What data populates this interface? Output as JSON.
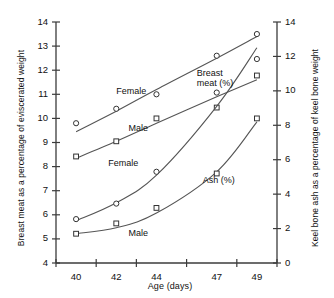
{
  "chart_data": {
    "type": "scatter",
    "title": "",
    "xlabel": "Age (days)",
    "ylabel": "Breast meat as a percentage of eviscerated weight",
    "ylabel_right": "Keel bone ash as a percentage of keel bone weight",
    "x_tick_labels": [
      "40",
      "42",
      "44",
      "47",
      "49"
    ],
    "x_values": [
      40,
      42,
      44,
      47,
      49
    ],
    "xlim": [
      39,
      50
    ],
    "ylim": [
      4,
      14
    ],
    "ylim_right": [
      0,
      14
    ],
    "y_tick_labels": [
      "4",
      "5",
      "6",
      "7",
      "8",
      "9",
      "10",
      "11",
      "12",
      "13",
      "14"
    ],
    "y_tick_values": [
      4,
      5,
      6,
      7,
      8,
      9,
      10,
      11,
      12,
      13,
      14
    ],
    "y_right_tick_labels": [
      "0",
      "2",
      "4",
      "6",
      "8",
      "10",
      "12",
      "14"
    ],
    "y_right_tick_values": [
      0,
      2,
      4,
      6,
      8,
      10,
      12,
      14
    ],
    "grid": false,
    "legend": "inline-annotations",
    "annotations": [
      {
        "text": "Breast\nmeat (%)",
        "line1": "Breast",
        "line2": "meat (%)",
        "x": 47.0,
        "y": 11.85
      },
      {
        "text": "Ash (%)",
        "line1": "Ash (%)",
        "line2": "",
        "x": 47.3,
        "y": 7.4
      },
      {
        "text": "Female",
        "line1": "Female",
        "line2": "",
        "x": 43.0,
        "y": 11.1
      },
      {
        "text": "Male",
        "line1": "Male",
        "line2": "",
        "x": 43.6,
        "y": 9.55
      },
      {
        "text": "Female",
        "line1": "Female",
        "line2": "",
        "x": 42.6,
        "y": 8.1
      },
      {
        "text": "Male",
        "line1": "Male",
        "line2": "",
        "x": 43.6,
        "y": 5.2
      }
    ],
    "series": [
      {
        "name": "Breast meat (%) - Female",
        "axis": "left",
        "marker": "circle",
        "points": [
          {
            "x": 40,
            "y": 9.8
          },
          {
            "x": 42,
            "y": 10.4
          },
          {
            "x": 44,
            "y": 11.0
          },
          {
            "x": 47,
            "y": 12.6
          },
          {
            "x": 49,
            "y": 13.5
          }
        ],
        "fit": [
          {
            "x": 40.0,
            "y": 9.45
          },
          {
            "x": 42.0,
            "y": 10.3
          },
          {
            "x": 44.0,
            "y": 11.2
          },
          {
            "x": 47.0,
            "y": 12.5
          },
          {
            "x": 49.0,
            "y": 13.4
          }
        ]
      },
      {
        "name": "Breast meat (%) - Male",
        "axis": "left",
        "marker": "square",
        "points": [
          {
            "x": 40,
            "y": 8.42
          },
          {
            "x": 42,
            "y": 9.05
          },
          {
            "x": 44,
            "y": 10.0
          },
          {
            "x": 47,
            "y": 10.45
          },
          {
            "x": 49,
            "y": 11.78
          }
        ],
        "fit": [
          {
            "x": 40.0,
            "y": 8.35
          },
          {
            "x": 42.0,
            "y": 9.05
          },
          {
            "x": 44.0,
            "y": 9.8
          },
          {
            "x": 47.0,
            "y": 10.9
          },
          {
            "x": 49.0,
            "y": 11.6
          }
        ]
      },
      {
        "name": "Ash (%) - Female",
        "axis": "right",
        "marker": "circle",
        "points": [
          {
            "x": 40,
            "y": 2.55
          },
          {
            "x": 42,
            "y": 3.45
          },
          {
            "x": 44,
            "y": 5.3
          },
          {
            "x": 47,
            "y": 9.9
          },
          {
            "x": 49,
            "y": 11.85
          }
        ],
        "fit": [
          {
            "x": 40.0,
            "y": 2.45
          },
          {
            "x": 42.0,
            "y": 3.5
          },
          {
            "x": 44.0,
            "y": 5.1
          },
          {
            "x": 47.0,
            "y": 9.1
          },
          {
            "x": 49.0,
            "y": 12.5
          }
        ]
      },
      {
        "name": "Ash (%) - Male",
        "axis": "right",
        "marker": "square",
        "points": [
          {
            "x": 40,
            "y": 1.7
          },
          {
            "x": 42,
            "y": 2.3
          },
          {
            "x": 44,
            "y": 3.2
          },
          {
            "x": 47,
            "y": 5.2
          },
          {
            "x": 49,
            "y": 8.4
          }
        ],
        "fit": [
          {
            "x": 40.0,
            "y": 1.7
          },
          {
            "x": 42.0,
            "y": 2.05
          },
          {
            "x": 44.0,
            "y": 2.9
          },
          {
            "x": 47.0,
            "y": 5.3
          },
          {
            "x": 49.0,
            "y": 8.2
          }
        ]
      }
    ],
    "colors": {
      "axis": "#3b3b3b",
      "line": "#555555",
      "marker_stroke": "#333333",
      "text": "#111111",
      "background": "#ffffff"
    }
  }
}
